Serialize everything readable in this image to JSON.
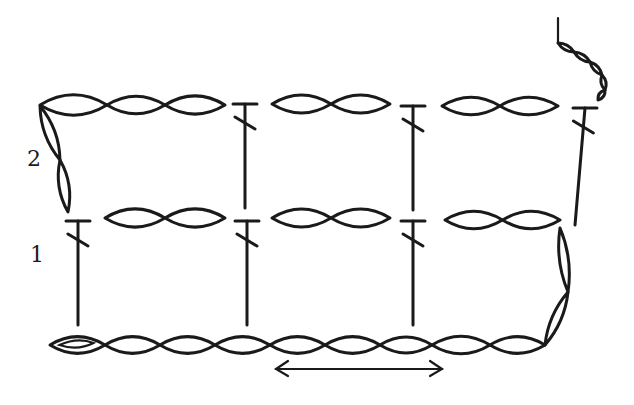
{
  "diagram": {
    "type": "crochet-stitch-chart",
    "row_labels": [
      {
        "label": "2",
        "x": 27,
        "y": 166
      },
      {
        "label": "1",
        "x": 30,
        "y": 262
      }
    ],
    "ink_color": "#1a1a1a",
    "background": "#ffffff",
    "legend": {
      "chain": "oval (ch)",
      "double_crochet": "T-bar with slash (dc)",
      "slip_knot": "oval with inner loop",
      "repeat_arrow": "double-headed arrow under foundation chain"
    },
    "foundation_chain": {
      "y": 345,
      "slip_knot": {
        "x1": 50,
        "x2": 105
      },
      "links": [
        [
          105,
          160
        ],
        [
          160,
          215
        ],
        [
          215,
          270
        ],
        [
          270,
          325
        ],
        [
          325,
          380
        ],
        [
          380,
          432
        ],
        [
          432,
          490
        ],
        [
          490,
          545
        ]
      ]
    },
    "row1": {
      "turning_chain": [
        [
          545,
          345,
          568,
          292
        ],
        [
          568,
          292,
          560,
          228
        ]
      ],
      "dc": [
        {
          "x": 78,
          "top": 221,
          "bottom": 325
        },
        {
          "x": 247,
          "top": 221,
          "bottom": 325
        },
        {
          "x": 413,
          "top": 221,
          "bottom": 325
        }
      ],
      "chain_pairs": [
        {
          "y": 218,
          "x1": 105,
          "x2": 225
        },
        {
          "y": 218,
          "x1": 272,
          "x2": 390
        },
        {
          "y": 220,
          "x1": 445,
          "x2": 560
        }
      ]
    },
    "row2": {
      "turning_chain": [
        [
          68,
          212,
          60,
          160
        ],
        [
          60,
          160,
          40,
          106
        ]
      ],
      "top_chain": {
        "y": 105,
        "links": [
          [
            40,
            107
          ],
          [
            107,
            165
          ],
          [
            165,
            225
          ]
        ]
      },
      "dc": [
        {
          "x": 245,
          "top": 104,
          "bottom": 208
        },
        {
          "x": 413,
          "top": 106,
          "bottom": 210
        },
        {
          "x": 585,
          "top": 108,
          "bottom": 225,
          "slant_to": 575
        }
      ],
      "chain_pairs": [
        {
          "y": 104,
          "x1": 272,
          "x2": 390
        },
        {
          "y": 106,
          "x1": 442,
          "x2": 558
        }
      ]
    },
    "tail": {
      "start": [
        558,
        18
      ],
      "links": [
        [
          558,
          43,
          574,
          52
        ],
        [
          574,
          52,
          590,
          62
        ],
        [
          590,
          62,
          602,
          75
        ],
        [
          602,
          75,
          605,
          90
        ],
        [
          605,
          90,
          598,
          100
        ]
      ]
    },
    "repeat_arrow": {
      "x1": 276,
      "x2": 442,
      "y": 369
    }
  }
}
